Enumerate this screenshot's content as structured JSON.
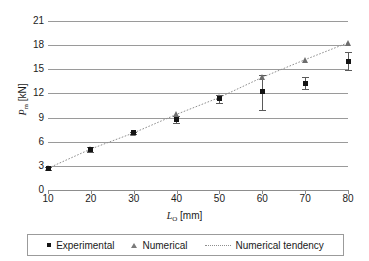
{
  "chart_data": {
    "type": "scatter",
    "title": "",
    "xlabel": "L_O [mm]",
    "xlabel_main": "L",
    "xlabel_sub": "O",
    "xlabel_unit": "[mm]",
    "ylabel": "P_m [kN]",
    "ylabel_main": "P",
    "ylabel_sub": "m",
    "ylabel_unit": "[kN]",
    "xlim": [
      10,
      80
    ],
    "ylim": [
      0,
      21
    ],
    "xticks": [
      10,
      20,
      30,
      40,
      50,
      60,
      70,
      80
    ],
    "yticks": [
      0,
      3,
      6,
      9,
      12,
      15,
      18,
      21
    ],
    "grid": "horizontal",
    "legend_position": "bottom",
    "x": [
      10,
      20,
      30,
      40,
      50,
      60,
      70,
      80
    ],
    "series": [
      {
        "name": "Experimental",
        "marker": "square",
        "color": "#141414",
        "values": [
          2.7,
          5.0,
          7.1,
          8.8,
          11.4,
          12.2,
          13.2,
          16.0
        ],
        "error_low": [
          2.5,
          4.7,
          7.0,
          8.3,
          10.8,
          10.0,
          12.5,
          14.9
        ],
        "error_high": [
          2.9,
          5.3,
          7.2,
          9.2,
          11.8,
          14.3,
          14.0,
          17.1
        ]
      },
      {
        "name": "Numerical",
        "marker": "triangle",
        "color": "#6d6d6d",
        "values": [
          2.7,
          5.1,
          7.1,
          9.4,
          11.5,
          14.0,
          16.2,
          18.3
        ]
      },
      {
        "name": "Numerical tendency",
        "marker": "dotted-line",
        "color": "#8e8e8e",
        "values": [
          2.7,
          5.1,
          7.1,
          9.4,
          11.5,
          14.0,
          16.2,
          18.3
        ]
      }
    ]
  },
  "legend": {
    "items": [
      {
        "label": "Experimental"
      },
      {
        "label": "Numerical"
      },
      {
        "label": "Numerical tendency"
      }
    ]
  }
}
